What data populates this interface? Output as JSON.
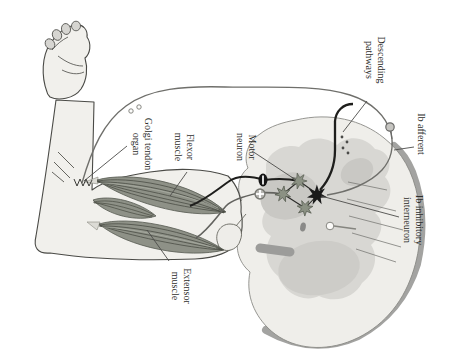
{
  "labels": {
    "golgi_tendon_organ": {
      "line1": "Golgi tendon",
      "line2": "organ"
    },
    "flexor_muscle": {
      "line1": "Flexor",
      "line2": "muscle"
    },
    "motor_neuron": {
      "line1": "Motor",
      "line2": "neuron"
    },
    "descending_pathways": {
      "line1": "Descending",
      "line2": "pathways"
    },
    "ib_afferent": {
      "line1": "Ib afferent"
    },
    "ib_inhibitory_interneuron": {
      "line1": "Ib inhibitory",
      "line2": "interneuron"
    },
    "extensor_muscle": {
      "line1": "Extensor",
      "line2": "muscle"
    }
  },
  "colors": {
    "background": "#ffffff",
    "skin_fill": "#f1f0ec",
    "outline": "#4a4a46",
    "muscle_fill": "#8e9187",
    "muscle_stripe": "#474a41",
    "white_matter": "#efeeea",
    "gray_matter": "#d8d7d3",
    "gray_matter_dark": "#c9c8c4",
    "cord_shadow": "#a3a3a1",
    "neuron_star": "#8b9183",
    "interneuron_star": "#1a1a1a",
    "axon_dark": "#1e1e1c",
    "axon_gray": "#6f6f6b",
    "label_text": "#2e2e2c"
  },
  "symbols": {
    "inhibitory_synapse": "filled-ellipse-with-slit",
    "excitatory_synapse": "open-circle-with-star",
    "motor_neuron_shape": "gray-star",
    "interneuron_shape": "black-star",
    "ganglion_cell": "small-circle-on-afferent"
  }
}
